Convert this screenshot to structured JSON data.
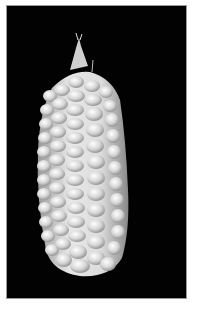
{
  "image": {
    "subject": "ear of white corn",
    "background": "black",
    "alt": "White ear of corn with rows of rounded kernels on a black background",
    "colors": {
      "background": "#020202",
      "border": "#9a9a9a",
      "kernel_light": "#f2f2f2",
      "kernel_mid": "#c8c8c8",
      "kernel_shadow": "#7a7a7a"
    }
  }
}
